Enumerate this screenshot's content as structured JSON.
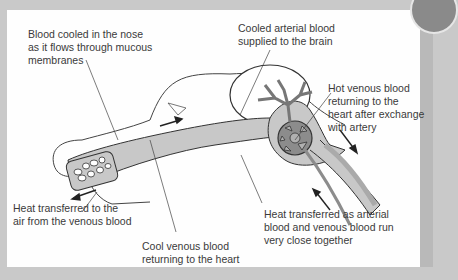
{
  "diagram": {
    "title": "",
    "labels": {
      "nose_cooling": "Blood cooled in the nose\nas it flows through mucous\nmembranes",
      "brain_supply": "Cooled arterial blood\nsupplied to the brain",
      "hot_venous": "Hot venous blood\nreturning to the\nheart after exchange\nwith artery",
      "heat_to_air": "Heat transferred to the\nair from the venous blood",
      "cool_venous": "Cool venous blood\nreturning to the heart",
      "heat_exchange": "Heat transferred as arterial\nblood and venous blood run\nvery close together"
    },
    "colors": {
      "frame": "#c9c9c9",
      "panel": "#fefefe",
      "vessel_fill": "#c8c8c8",
      "vessel_dark": "#8c8c8c",
      "outline": "#333333",
      "text": "#3a3a3a"
    }
  }
}
